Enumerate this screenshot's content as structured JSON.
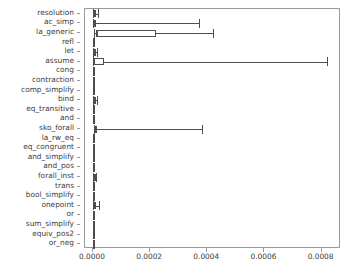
{
  "chart_data": {
    "type": "box",
    "title": "",
    "xlabel": "",
    "ylabel": "",
    "orientation": "horizontal",
    "grid": false,
    "legend": false,
    "xlim": [
      -2.8e-05,
      0.000868
    ],
    "xticks": [
      0.0,
      0.0002,
      0.0004,
      0.0006,
      0.0008
    ],
    "xticklabels": [
      "0.0000",
      "0.0002",
      "0.0004",
      "0.0006",
      "0.0008"
    ],
    "categories": [
      "resolution",
      "ac_simp",
      "la_generic",
      "refl",
      "let",
      "assume",
      "cong",
      "contraction",
      "comp_simplify",
      "bind",
      "eq_transitive",
      "and",
      "sko_forall",
      "la_rw_eq",
      "eq_congruent",
      "and_simplify",
      "and_pos",
      "forall_inst",
      "trans",
      "bool_simplify",
      "onepoint",
      "or",
      "sum_simplify",
      "equiv_pos2",
      "or_neg"
    ],
    "boxes": [
      {
        "label": "resolution",
        "whislo": 5e-07,
        "q1": 3e-06,
        "med": 5.5e-06,
        "q3": 8.5e-06,
        "whishi": 1.75e-05
      },
      {
        "label": "ac_simp",
        "whislo": 5e-07,
        "q1": 2.5e-06,
        "med": 5.5e-06,
        "q3": 9e-06,
        "whishi": 0.00037
      },
      {
        "label": "la_generic",
        "whislo": 4e-06,
        "q1": 1.1e-05,
        "med": 1.3e-05,
        "q3": 0.00022,
        "whishi": 0.00042
      },
      {
        "label": "refl",
        "whislo": 1e-06,
        "q1": 1.3e-06,
        "med": 1.6e-06,
        "q3": 1.9e-06,
        "whishi": 2.2e-06
      },
      {
        "label": "let",
        "whislo": 5e-07,
        "q1": 2.5e-06,
        "med": 3.5e-06,
        "q3": 5e-06,
        "whishi": 1.3e-05
      },
      {
        "label": "assume",
        "whislo": 5e-07,
        "q1": 2e-06,
        "med": 3e-06,
        "q3": 3.9e-05,
        "whishi": 0.00082
      },
      {
        "label": "cong",
        "whislo": 8e-07,
        "q1": 1.1e-06,
        "med": 1.3e-06,
        "q3": 1.6e-06,
        "whishi": 1.9e-06
      },
      {
        "label": "contraction",
        "whislo": 8e-07,
        "q1": 1.1e-06,
        "med": 1.4e-06,
        "q3": 1.7e-06,
        "whishi": 2.1e-06
      },
      {
        "label": "comp_simplify",
        "whislo": 8e-07,
        "q1": 1.1e-06,
        "med": 1.4e-06,
        "q3": 1.7e-06,
        "whishi": 2.1e-06
      },
      {
        "label": "bind",
        "whislo": 5e-07,
        "q1": 2.2e-06,
        "med": 3.2e-06,
        "q3": 4.8e-06,
        "whishi": 1.25e-05
      },
      {
        "label": "eq_transitive",
        "whislo": 8e-07,
        "q1": 1.1e-06,
        "med": 1.4e-06,
        "q3": 1.7e-06,
        "whishi": 2.1e-06
      },
      {
        "label": "and",
        "whislo": 6e-07,
        "q1": 1.4e-06,
        "med": 2e-06,
        "q3": 2.8e-06,
        "whishi": 4.8e-06
      },
      {
        "label": "sko_forall",
        "whislo": 2e-06,
        "q1": 5.5e-06,
        "med": 8e-06,
        "q3": 1.25e-05,
        "whishi": 0.00038
      },
      {
        "label": "la_rw_eq",
        "whislo": 8e-07,
        "q1": 1.1e-06,
        "med": 1.4e-06,
        "q3": 1.7e-06,
        "whishi": 2.1e-06
      },
      {
        "label": "eq_congruent",
        "whislo": 8e-07,
        "q1": 1.1e-06,
        "med": 1.4e-06,
        "q3": 1.7e-06,
        "whishi": 2.1e-06
      },
      {
        "label": "and_simplify",
        "whislo": 8e-07,
        "q1": 1.1e-06,
        "med": 1.4e-06,
        "q3": 1.7e-06,
        "whishi": 2.1e-06
      },
      {
        "label": "and_pos",
        "whislo": 8e-07,
        "q1": 1.1e-06,
        "med": 1.4e-06,
        "q3": 1.7e-06,
        "whishi": 2.1e-06
      },
      {
        "label": "forall_inst",
        "whislo": 1e-06,
        "q1": 3.6e-06,
        "med": 5e-06,
        "q3": 6.8e-06,
        "whishi": 1.15e-05
      },
      {
        "label": "trans",
        "whislo": 8e-07,
        "q1": 1.1e-06,
        "med": 1.4e-06,
        "q3": 1.7e-06,
        "whishi": 2.1e-06
      },
      {
        "label": "bool_simplify",
        "whislo": 8e-07,
        "q1": 1.1e-06,
        "med": 1.4e-06,
        "q3": 1.7e-06,
        "whishi": 2.1e-06
      },
      {
        "label": "onepoint",
        "whislo": 1e-06,
        "q1": 4.5e-06,
        "med": 6.5e-06,
        "q3": 1e-05,
        "whishi": 2.1e-05
      },
      {
        "label": "or",
        "whislo": 8e-07,
        "q1": 1.1e-06,
        "med": 1.4e-06,
        "q3": 1.7e-06,
        "whishi": 2.1e-06
      },
      {
        "label": "sum_simplify",
        "whislo": 8e-07,
        "q1": 1.1e-06,
        "med": 1.4e-06,
        "q3": 1.7e-06,
        "whishi": 2.1e-06
      },
      {
        "label": "equiv_pos2",
        "whislo": 8e-07,
        "q1": 1.1e-06,
        "med": 1.4e-06,
        "q3": 1.7e-06,
        "whishi": 2.1e-06
      },
      {
        "label": "or_neg",
        "whislo": 4e-07,
        "q1": 1.2e-06,
        "med": 1.8e-06,
        "q3": 2.4e-06,
        "whishi": 4e-06
      }
    ],
    "colors": {
      "box_edge": "#4d4d4d",
      "box_face": "#ffffff",
      "whisker": "#4d4d4d",
      "median": "#4d4d4d",
      "axis": "#9a9a9a",
      "tick_text": "#3b3b3b",
      "background": "#ffffff"
    }
  }
}
